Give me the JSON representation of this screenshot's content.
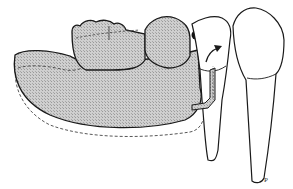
{
  "figure": {
    "type": "dental illustration",
    "label": "P",
    "colors": {
      "outline": "#1a1a1a",
      "base_fill": "#c4c4c4",
      "background": "#ffffff"
    }
  }
}
